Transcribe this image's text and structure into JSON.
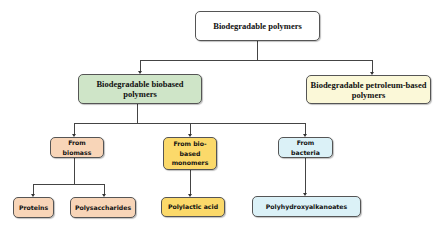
{
  "diagram": {
    "type": "hierarchy-tree",
    "root": {
      "label": "Biodegradable polymers",
      "color": "#ffffff"
    },
    "level1": [
      {
        "label_line1": "Biodegradable biobased",
        "label_line2": "polymers",
        "color": "#cfe5c8"
      },
      {
        "label_line1": "Biodegradable petroleum-based",
        "label_line2": "polymers",
        "color": "#fbf8d8"
      }
    ],
    "level2": [
      {
        "label_line1": "From",
        "label_line2": "biomass",
        "color": "#f8d5b8"
      },
      {
        "label_line1": "From bio-",
        "label_line2": "based",
        "label_line3": "monomers",
        "color": "#fbd96a"
      },
      {
        "label_line1": "From",
        "label_line2": "bacteria",
        "color": "#dbf1f7"
      }
    ],
    "level3": [
      {
        "label": "Proteins",
        "color": "#f8d5b8"
      },
      {
        "label": "Polysaccharides",
        "color": "#f8d5b8"
      },
      {
        "label": "Polylactic acid",
        "color": "#fbd96a"
      },
      {
        "label": "Polyhydroxyalkanoates",
        "color": "#dbf1f7"
      }
    ]
  }
}
